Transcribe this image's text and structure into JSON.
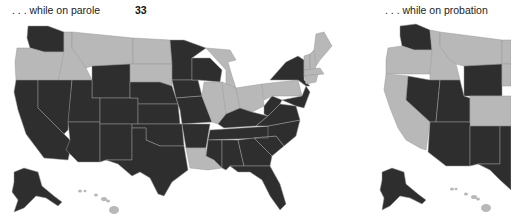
{
  "colors": {
    "dark": "#2e2e2e",
    "light": "#b8b8b8",
    "border": "#9a9a9a"
  },
  "panels": [
    {
      "caption": ". . . while on parole",
      "count": "33",
      "light_states": [
        "OR",
        "ID",
        "MT",
        "ND",
        "SD",
        "MI",
        "IL",
        "IN",
        "OH",
        "PA",
        "ME",
        "VT",
        "NH",
        "MA",
        "RI",
        "CT",
        "LA",
        "HI"
      ],
      "dark_states": [
        "WA",
        "CA",
        "NV",
        "UT",
        "AZ",
        "WY",
        "CO",
        "NM",
        "NE",
        "KS",
        "OK",
        "TX",
        "MN",
        "IA",
        "MO",
        "AR",
        "WI",
        "KY",
        "TN",
        "MS",
        "AL",
        "GA",
        "FL",
        "SC",
        "NC",
        "VA",
        "WV",
        "MD",
        "DE",
        "NJ",
        "NY",
        "AK"
      ]
    },
    {
      "caption": ". . . while on probation",
      "count": "",
      "light_states": [
        "OR",
        "ID",
        "MT",
        "CA",
        "CO",
        "HI"
      ],
      "dark_states": [
        "WA",
        "NV",
        "UT",
        "AZ",
        "WY",
        "NM",
        "TX",
        "AK"
      ]
    }
  ]
}
